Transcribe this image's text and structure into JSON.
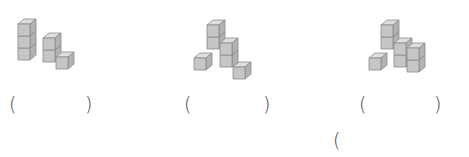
{
  "worksheet": {
    "instruction": "",
    "figures": [
      {
        "id": 1,
        "description": "cube stack: column of 3 at back-left, column of 2 in middle, 1 cube front-right",
        "answer_blank": {
          "open": "(",
          "close": ")",
          "value": ""
        },
        "cubes": [
          [
            18,
            48
          ],
          [
            18,
            36
          ],
          [
            18,
            24
          ],
          [
            43,
            50
          ],
          [
            43,
            38
          ],
          [
            56,
            57
          ]
        ]
      },
      {
        "id": 2,
        "description": "cube stack: column of 2 at back, column of 2 middle-right, 1 cube front-left, 1 cube front-right",
        "answer_blank": {
          "open": "(",
          "close": ")",
          "value": ""
        },
        "cubes": [
          [
            207,
            37
          ],
          [
            207,
            25
          ],
          [
            220,
            55
          ],
          [
            220,
            43
          ],
          [
            194,
            58
          ],
          [
            233,
            67
          ]
        ]
      },
      {
        "id": 3,
        "description": "cube stack: column of 2 at back, column of 2 middle, column of 2 right, 1 cube front-left",
        "answer_blank": {
          "open": "(",
          "close": ")",
          "value": ""
        },
        "cubes": [
          [
            381,
            37
          ],
          [
            381,
            25
          ],
          [
            394,
            55
          ],
          [
            394,
            43
          ],
          [
            407,
            60
          ],
          [
            407,
            48
          ],
          [
            369,
            58
          ]
        ]
      }
    ],
    "extra_blank": {
      "open": "("
    }
  },
  "style": {
    "top_face": "#dedede",
    "front_face": "#c6c6c6",
    "side_face": "#b2b2b2",
    "edge": "#8c8c8c"
  }
}
